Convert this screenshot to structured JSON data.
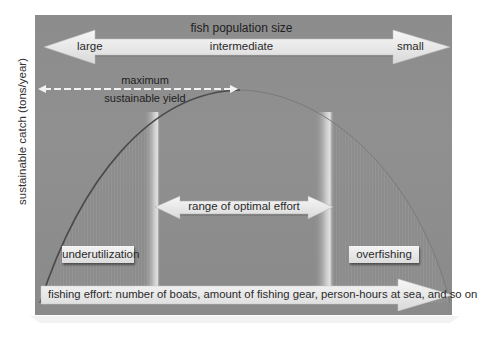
{
  "diagram": {
    "title": "fish population size",
    "population_arrow": {
      "left_label": "large",
      "center_label": "intermediate",
      "right_label": "small"
    },
    "msy_label_line1": "maximum",
    "msy_label_line2": "sustainable yield",
    "y_axis_label": "sustainable catch (tons/year)",
    "optimal_range_label": "range of optimal effort",
    "zones": {
      "left": "underutilization",
      "right": "overfishing"
    },
    "x_axis_label": "fishing effort: number of boats, amount of fishing gear, person-hours at sea, and so on"
  },
  "colors": {
    "panel_bg": "#8f8f8f",
    "arrow_fill": "#ebebeb",
    "curve": "#555555",
    "band_highlight": "#d6d6d6"
  }
}
